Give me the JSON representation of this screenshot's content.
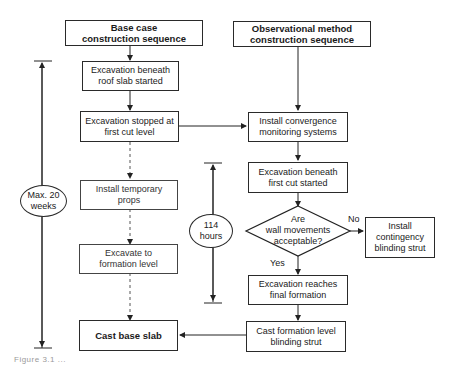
{
  "columns": {
    "base_case": {
      "title": "Base case\nconstruction sequence"
    },
    "observational": {
      "title": "Observational method\nconstruction sequence"
    }
  },
  "base_case_steps": [
    {
      "id": "b1",
      "label": "Excavation beneath roof slab started",
      "line1": "Excavation beneath",
      "line2": "roof slab started"
    },
    {
      "id": "b2",
      "label": "Excavation stopped at first cut level",
      "line1": "Excavation stopped at",
      "line2": "first cut level"
    },
    {
      "id": "b3",
      "label": "Install temporary props",
      "line1": "Install temporary",
      "line2": "props"
    },
    {
      "id": "b4",
      "label": "Excavate to formation level",
      "line1": "Excavate to",
      "line2": "formation level"
    },
    {
      "id": "b5",
      "label": "Cast base slab",
      "line1": "Cast base slab",
      "line2": ""
    }
  ],
  "observational_steps": [
    {
      "id": "o1",
      "label": "Install convergence monitoring systems",
      "line1": "Install convergence",
      "line2": "monitoring systems"
    },
    {
      "id": "o2",
      "label": "Excavation beneath first cut started",
      "line1": "Excavation beneath",
      "line2": "first cut started"
    },
    {
      "id": "o3",
      "label": "Excavation reaches final formation",
      "line1": "Excavation reaches",
      "line2": "final formation"
    },
    {
      "id": "o4",
      "label": "Cast formation level blinding strut",
      "line1": "Cast formation level",
      "line2": "blinding strut"
    }
  ],
  "decision": {
    "line1": "Are",
    "line2": "wall movements",
    "line3": "acceptable?",
    "yes": "Yes",
    "no": "No"
  },
  "contingency": {
    "line1": "Install",
    "line2": "contingency",
    "line3": "blinding strut"
  },
  "durations": {
    "base": {
      "line1": "Max. 20",
      "line2": "weeks"
    },
    "observational": {
      "line1": "114",
      "line2": "hours"
    }
  },
  "column_titles": {
    "base_line1": "Base case",
    "base_line2": "construction sequence",
    "obs_line1": "Observational method",
    "obs_line2": "construction sequence"
  },
  "caption": "Figure 3.1  ..."
}
